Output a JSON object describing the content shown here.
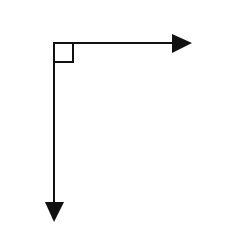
{
  "diagram": {
    "type": "perpendicular-vectors",
    "colors": {
      "stroke": "#111111",
      "background": "#ffffff"
    },
    "origin": {
      "x": 54,
      "y": 43
    },
    "right_angle_marker": {
      "size": 19
    },
    "arrows": [
      {
        "name": "horizontal-arrow",
        "direction": "right",
        "end": {
          "x": 192,
          "y": 43
        }
      },
      {
        "name": "vertical-arrow",
        "direction": "down",
        "end": {
          "x": 54,
          "y": 222
        }
      }
    ]
  }
}
